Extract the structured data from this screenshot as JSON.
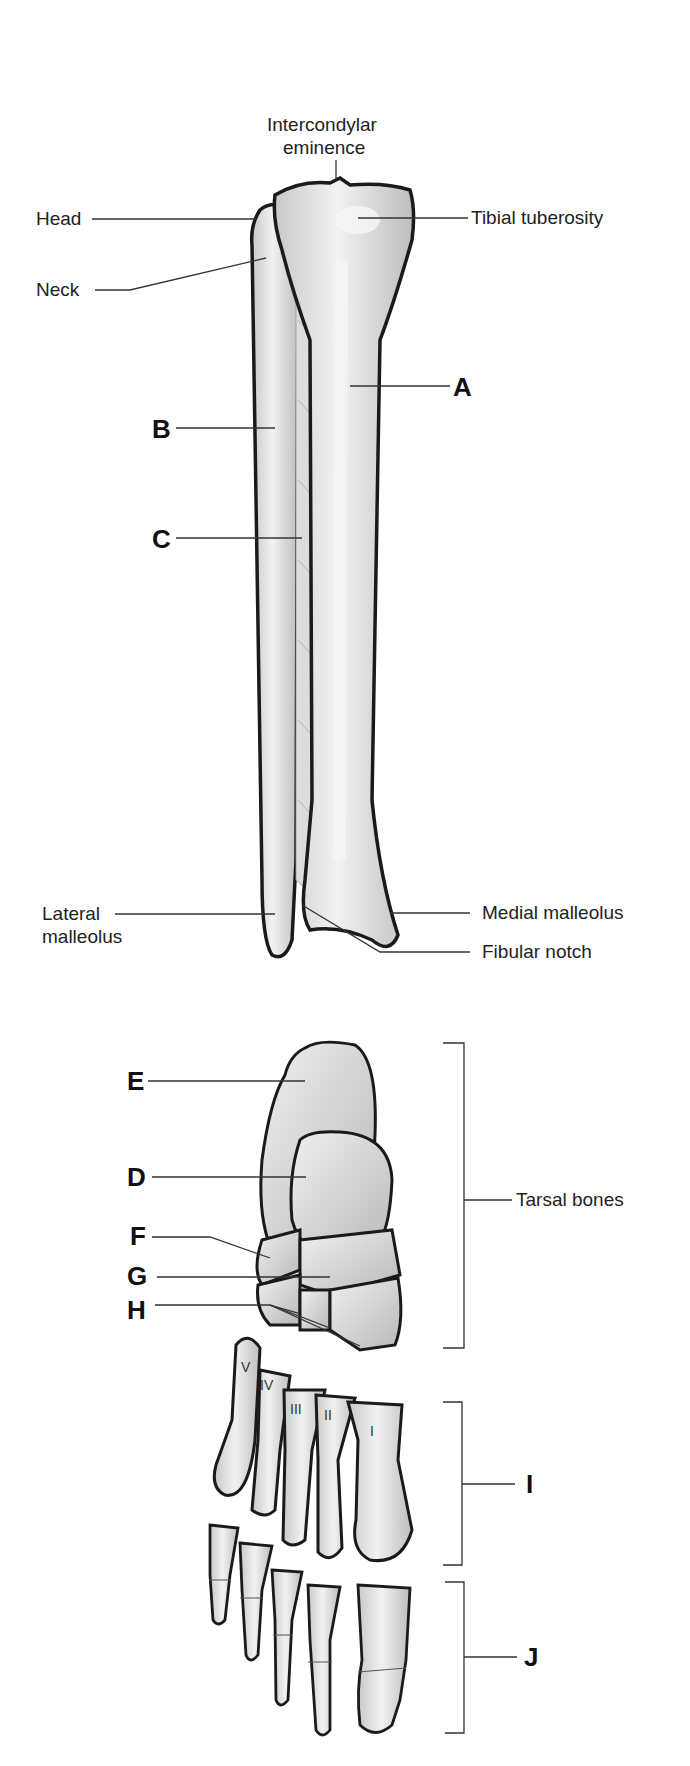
{
  "figure": {
    "leg_labels": {
      "intercondylar_line1": "Intercondylar",
      "intercondylar_line2": "eminence",
      "head": "Head",
      "neck": "Neck",
      "tibial_tuberosity": "Tibial tuberosity",
      "lateral_malleolus_line1": "Lateral",
      "lateral_malleolus_line2": "malleolus",
      "medial_malleolus": "Medial malleolus",
      "fibular_notch": "Fibular notch"
    },
    "leg_letters": {
      "A": "A",
      "B": "B",
      "C": "C"
    },
    "foot_labels": {
      "tarsal_bones": "Tarsal bones"
    },
    "foot_letters": {
      "D": "D",
      "E": "E",
      "F": "F",
      "G": "G",
      "H": "H",
      "I": "I",
      "J": "J"
    },
    "metatarsal_numerals": [
      "V",
      "IV",
      "III",
      "II",
      "I"
    ],
    "colors": {
      "bone_fill": "#e4e4e4",
      "bone_outline": "#1a1a1a",
      "leader_line": "#333333",
      "background": "#ffffff"
    }
  }
}
